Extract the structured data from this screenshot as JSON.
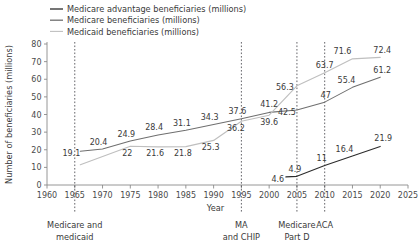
{
  "chart_data": {
    "type": "line",
    "title": "",
    "xlabel": "Year",
    "ylabel": "Number of beneficiaries (millions)",
    "xlim": [
      1960,
      2025
    ],
    "ylim": [
      0,
      80
    ],
    "xticks": [
      1960,
      1965,
      1970,
      1975,
      1980,
      1985,
      1990,
      1995,
      2000,
      2005,
      2010,
      2015,
      2020,
      2025
    ],
    "yticks": [
      0,
      10,
      20,
      30,
      40,
      50,
      60,
      70,
      80
    ],
    "grid": false,
    "legend_position": "top-left",
    "series": [
      {
        "name": "Medicare advantage beneficiaries (millions)",
        "color": "#2b2b2b",
        "x": [
          2003,
          2005,
          2010,
          2015,
          2020
        ],
        "values": [
          4.6,
          4.9,
          11,
          16.4,
          21.9
        ],
        "labels": [
          "4.6",
          "4.9",
          "11",
          "16.4",
          "21.9"
        ]
      },
      {
        "name": "Medicare beneficiaries (millions)",
        "color": "#6f6f6f",
        "x": [
          1966,
          1970,
          1975,
          1980,
          1985,
          1990,
          1995,
          2000,
          2005,
          2010,
          2015,
          2020
        ],
        "values": [
          19.1,
          20.4,
          24.9,
          28.4,
          31.1,
          34.3,
          37.6,
          41.2,
          42.5,
          47,
          55.4,
          61.2
        ],
        "labels": [
          "19.1",
          "20.4",
          "24.9",
          "28.4",
          "31.1",
          "34.3",
          "37.6",
          "41.2",
          "42.5",
          "47",
          "55.4",
          "61.2"
        ]
      },
      {
        "name": "Medicaid beneficiaries (millions)",
        "color": "#bfbfbf",
        "x": [
          1966,
          1975,
          1980,
          1985,
          1990,
          1995,
          2000,
          2005,
          2010,
          2015,
          2020
        ],
        "values": [
          11.5,
          22,
          21.6,
          21.8,
          25.3,
          36.2,
          39.6,
          56.3,
          63.7,
          71.6,
          72.4
        ],
        "labels": [
          "",
          "22",
          "21.6",
          "21.8",
          "25.3",
          "36.2",
          "39.6",
          "56.3",
          "63.7",
          "71.6",
          "72.4"
        ]
      }
    ],
    "event_lines": [
      {
        "year": 1965,
        "label_line1": "Medicare and",
        "label_line2": "medicaid"
      },
      {
        "year": 1995,
        "label_line1": "MA",
        "label_line2": "and CHIP"
      },
      {
        "year": 2005,
        "label_line1": "Medicare",
        "label_line2": "Part D"
      },
      {
        "year": 2010,
        "label_line1": "ACA",
        "label_line2": ""
      }
    ]
  }
}
